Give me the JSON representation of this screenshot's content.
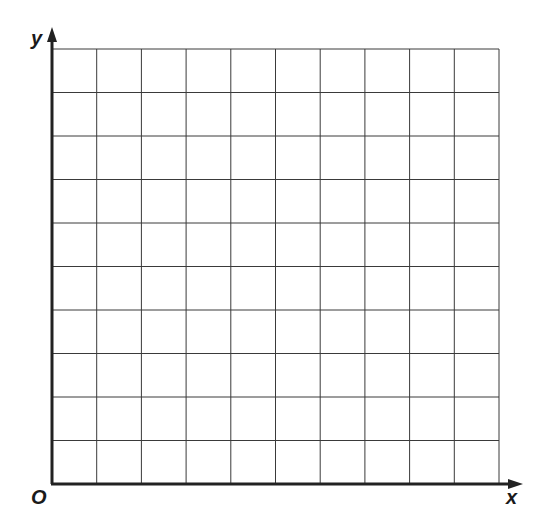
{
  "diagram": {
    "type": "blank-coordinate-grid",
    "labels": {
      "y_axis": "y",
      "x_axis": "x",
      "origin": "O"
    },
    "grid": {
      "columns": 10,
      "rows": 10
    },
    "colors": {
      "grid_line": "#3a3a3a",
      "axis": "#222222",
      "background": "#ffffff"
    }
  }
}
